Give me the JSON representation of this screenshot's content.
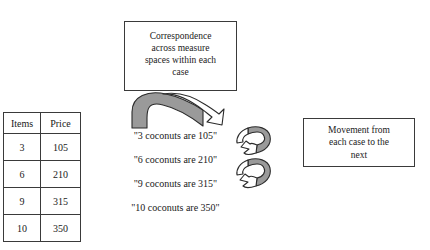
{
  "diagram": {
    "title_boxes": {
      "correspondence": {
        "lines": [
          "Correspondence",
          "across measure",
          "spaces within each",
          "case"
        ]
      },
      "movement": {
        "lines": [
          "Movement from",
          "each case to the",
          "next"
        ]
      }
    },
    "table": {
      "headers": [
        "Items",
        "Price"
      ],
      "rows": [
        [
          "3",
          "105"
        ],
        [
          "6",
          "210"
        ],
        [
          "9",
          "315"
        ],
        [
          "10",
          "350"
        ]
      ]
    },
    "statements": [
      "\"3 coconuts are 105\"",
      "\"6 coconuts are 210\"",
      "\"9 coconuts are 315\"",
      "\"10 coconuts are 350\""
    ],
    "arrows": {
      "arch": {
        "name": "curved-arch-arrow-right"
      },
      "twist": {
        "name": "twisted-double-arrow-down"
      }
    },
    "colors": {
      "outline": "#3a3a3a",
      "arrow_fill_shaded": "#9a9a9a",
      "arrow_fill_light": "#ffffff",
      "text": "#1a1a1a",
      "background": "#ffffff"
    }
  }
}
